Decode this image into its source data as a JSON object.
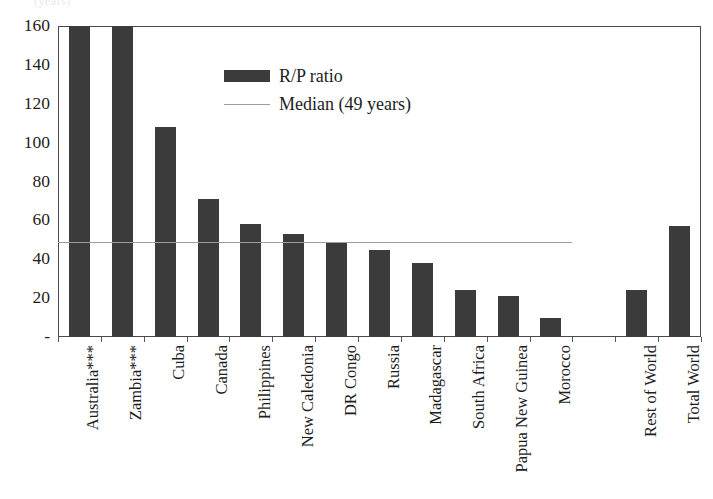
{
  "chart_data": {
    "type": "bar",
    "title": "",
    "subtitle": "",
    "xlabel": "",
    "ylabel": "",
    "ylim": [
      0,
      160
    ],
    "ytick_labels": [
      "160",
      "140",
      "120",
      "100",
      "80",
      "60",
      "40",
      "20",
      "-"
    ],
    "ytick_values": [
      160,
      140,
      120,
      100,
      80,
      60,
      40,
      20,
      0
    ],
    "grid": false,
    "legend_position": "inside-top-center",
    "categories": [
      "Australia***",
      "Zambia***",
      "Cuba",
      "Canada",
      "Philippines",
      "New Caledonia",
      "DR Congo",
      "Russia",
      "Madagascar",
      "South Africa",
      "Papua New Guinea",
      "Morocco",
      "",
      "Rest of World",
      "Total World"
    ],
    "series": [
      {
        "name": "R/P ratio",
        "color": "#3b3b3b",
        "values": [
          175,
          172,
          108,
          71,
          58,
          53,
          49,
          45,
          38,
          24,
          21,
          10,
          null,
          24,
          57
        ]
      }
    ],
    "reference_lines": [
      {
        "name": "Median (49 years)",
        "value": 49,
        "color": "#9c9c9c",
        "extent_categories": [
          "Australia***",
          "Morocco"
        ]
      }
    ],
    "legend": [
      {
        "label": "R/P ratio",
        "marker": "bar-swatch",
        "color": "#3b3b3b"
      },
      {
        "label": "Median (49 years)",
        "marker": "line-swatch",
        "color": "#9c9c9c"
      }
    ]
  },
  "top_sliver": "(years)"
}
